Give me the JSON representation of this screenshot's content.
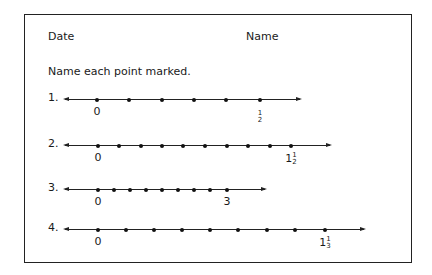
{
  "worksheet": {
    "date_label": "Date",
    "name_label": "Name",
    "instruction": "Name each point marked.",
    "problems": [
      {
        "number": "1.",
        "y": 99,
        "line_start": 65,
        "line_end": 300,
        "points_x": [
          97,
          129,
          162,
          194,
          226,
          260
        ],
        "labels": [
          {
            "x": 97,
            "whole": "0",
            "num": "",
            "den": ""
          },
          {
            "x": 260,
            "whole": "",
            "num": "1",
            "den": "2"
          }
        ]
      },
      {
        "number": "2.",
        "y": 145,
        "line_start": 65,
        "line_end": 330,
        "points_x": [
          98,
          119,
          141,
          162,
          183,
          205,
          227,
          248,
          270,
          291
        ],
        "labels": [
          {
            "x": 98,
            "whole": "0",
            "num": "",
            "den": ""
          },
          {
            "x": 291,
            "whole": "1",
            "num": "1",
            "den": "2"
          }
        ]
      },
      {
        "number": "3.",
        "y": 189,
        "line_start": 65,
        "line_end": 265,
        "points_x": [
          98,
          114,
          130,
          146,
          162,
          178,
          194,
          210,
          227
        ],
        "labels": [
          {
            "x": 98,
            "whole": "0",
            "num": "",
            "den": ""
          },
          {
            "x": 227,
            "whole": "3",
            "num": "",
            "den": ""
          }
        ]
      },
      {
        "number": "4.",
        "y": 229,
        "line_start": 65,
        "line_end": 364,
        "points_x": [
          98,
          126,
          154,
          182,
          210,
          238,
          267,
          295,
          325
        ],
        "labels": [
          {
            "x": 98,
            "whole": "0",
            "num": "",
            "den": ""
          },
          {
            "x": 325,
            "whole": "1",
            "num": "1",
            "den": "3"
          }
        ]
      }
    ]
  }
}
